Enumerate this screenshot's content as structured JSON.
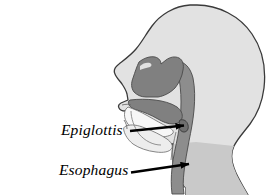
{
  "figure": {
    "background_color": "#ffffff",
    "width": 274,
    "height": 195
  },
  "palette": {
    "head_fill": "#e2e2e2",
    "head_outline": "#3a3a3a",
    "cavity_dark": "#808080",
    "pharynx_gray": "#8d8d8d",
    "neck_shadow": "#c9c9c9",
    "mouth_white": "#f7f7f7",
    "tongue_fill": "#ededed",
    "label_color": "#000000",
    "arrow_color": "#000000"
  },
  "labels": [
    {
      "id": "epiglottis",
      "text": "Epiglottis",
      "style": "italic-serif",
      "anchor_x": 61,
      "anchor_y": 122,
      "arrow_from_x": 130,
      "arrow_from_y": 131,
      "arrow_to_x": 186,
      "arrow_to_y": 125
    },
    {
      "id": "esophagus",
      "text": "Esophagus",
      "style": "italic-serif",
      "anchor_x": 59,
      "anchor_y": 162,
      "arrow_from_x": 131,
      "arrow_from_y": 173,
      "arrow_to_x": 191,
      "arrow_to_y": 164
    }
  ],
  "structures": [
    {
      "id": "head-profile",
      "name": "head-and-neck-outline",
      "fill": "#e2e2e2"
    },
    {
      "id": "neck-shadow",
      "name": "neck-shadow-region",
      "fill": "#c9c9c9"
    },
    {
      "id": "nasal-cavity",
      "name": "nasal-cavity",
      "fill": "#808080"
    },
    {
      "id": "soft-palate",
      "name": "soft-palate",
      "fill": "#808080"
    },
    {
      "id": "pharynx",
      "name": "pharynx-and-esophagus-column",
      "fill": "#8d8d8d"
    },
    {
      "id": "oral-cavity",
      "name": "oral-cavity",
      "fill": "#f7f7f7"
    },
    {
      "id": "tongue",
      "name": "tongue",
      "fill": "#ededed"
    },
    {
      "id": "epiglottis-flap",
      "name": "epiglottis-flap",
      "fill": "#6f6f6f"
    }
  ]
}
